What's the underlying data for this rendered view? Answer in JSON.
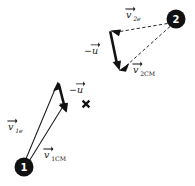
{
  "figure": {
    "background_color": "#ffffff",
    "ink_color": "#121212",
    "width": 195,
    "height": 186
  },
  "nodes": [
    {
      "id": "particle-1",
      "label": "1",
      "cx": 24,
      "cy": 167,
      "r": 9.5,
      "fill": "#111111",
      "text_color": "#ffffff"
    },
    {
      "id": "particle-2",
      "label": "2",
      "cx": 176,
      "cy": 19,
      "r": 9.5,
      "fill": "#111111",
      "text_color": "#ffffff"
    }
  ],
  "markers": [
    {
      "id": "center-of-mass",
      "glyph": "x",
      "x": 86,
      "y": 104
    }
  ],
  "labels": [
    {
      "id": "label-v1e",
      "base": "v",
      "sub": "1e",
      "sub_italic": true,
      "accent": "vector-arrow",
      "x": 10,
      "y": 129,
      "full_text": "v⃗1e"
    },
    {
      "id": "label-v1cm",
      "base": "v",
      "sub": "1CM",
      "sub_italic": false,
      "accent": "vector-arrow",
      "x": 45,
      "y": 157,
      "full_text": "v⃗1CM"
    },
    {
      "id": "label-minus-u-lower",
      "base": "−u",
      "sub": "",
      "sub_italic": false,
      "accent": "vector-arrow",
      "x": 71,
      "y": 92,
      "full_text": "−u⃗"
    },
    {
      "id": "label-v2e",
      "base": "v",
      "sub": "2e",
      "sub_italic": true,
      "accent": "vector-arrow",
      "x": 127,
      "y": 17,
      "full_text": "v⃗2e"
    },
    {
      "id": "label-v2cm",
      "base": "v",
      "sub": "2CM",
      "sub_italic": false,
      "accent": "vector-arrow",
      "x": 134,
      "y": 72,
      "full_text": "v⃗2CM"
    },
    {
      "id": "label-minus-u-upper",
      "base": "−u",
      "sub": "",
      "sub_italic": false,
      "accent": "vector-arrow",
      "x": 86,
      "y": 53,
      "full_text": "−u⃗"
    }
  ],
  "vectors": [
    {
      "id": "vector-v1e",
      "label_ref": "label-v1e",
      "style": "solid-thin",
      "from": [
        25,
        161
      ],
      "to": [
        57,
        84
      ],
      "arrowhead": "filled-at-tip"
    },
    {
      "id": "vector-v1cm",
      "label_ref": "label-v1cm",
      "style": "solid-thin",
      "from": [
        29,
        161
      ],
      "to": [
        65,
        113
      ],
      "arrowhead": "filled-at-tip"
    },
    {
      "id": "vector-minus-u-lower",
      "label_ref": "label-minus-u-lower",
      "style": "solid-thick",
      "from": [
        58,
        82
      ],
      "to": [
        66,
        112
      ],
      "arrowhead": "filled-at-tip"
    },
    {
      "id": "vector-v2e",
      "label_ref": "label-v2e",
      "style": "dashed",
      "from": [
        168,
        23
      ],
      "to": [
        113,
        33
      ],
      "arrowhead": "filled-at-tip"
    },
    {
      "id": "vector-v2cm",
      "label_ref": "label-v2cm",
      "style": "dashed",
      "from": [
        170,
        26
      ],
      "to": [
        122,
        70
      ],
      "arrowhead": "filled-at-tip"
    },
    {
      "id": "vector-minus-u-upper",
      "label_ref": "label-minus-u-upper",
      "style": "solid-thick",
      "from": [
        110,
        31
      ],
      "to": [
        119,
        69
      ],
      "arrowhead": "filled-at-tip"
    }
  ]
}
